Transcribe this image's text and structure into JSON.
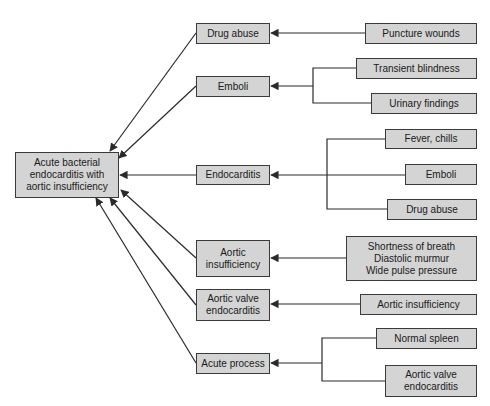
{
  "diagram": {
    "conclusion": "Acute bacterial\nendocarditis with\naortic insufficiency",
    "middle": [
      {
        "id": "drug_abuse",
        "label": "Drug abuse"
      },
      {
        "id": "emboli",
        "label": "Emboli"
      },
      {
        "id": "endocarditis",
        "label": "Endocarditis"
      },
      {
        "id": "aortic_insufficiency",
        "label": "Aortic\ninsufficiency"
      },
      {
        "id": "aortic_valve_endocarditis",
        "label": "Aortic valve\nendocarditis"
      },
      {
        "id": "acute_process",
        "label": "Acute process"
      }
    ],
    "evidence": [
      {
        "label": "Puncture wounds",
        "supports": "drug_abuse"
      },
      {
        "label": "Transient blindness",
        "supports": "emboli"
      },
      {
        "label": "Urinary findings",
        "supports": "emboli"
      },
      {
        "label": "Fever, chills",
        "supports": "endocarditis"
      },
      {
        "label": "Emboli",
        "supports": "endocarditis"
      },
      {
        "label": "Drug abuse",
        "supports": "endocarditis"
      },
      {
        "label": "Shortness of breath\nDiastolic murmur\nWide pulse pressure",
        "supports": "aortic_insufficiency"
      },
      {
        "label": "Aortic insufficiency",
        "supports": "aortic_valve_endocarditis"
      },
      {
        "label": "Normal spleen",
        "supports": "acute_process"
      },
      {
        "label": "Aortic valve\nendocarditis",
        "supports": "acute_process"
      }
    ],
    "colors": {
      "box_fill": "#d4d4d4",
      "box_border": "#3a3a3a",
      "line": "#2a2a2a"
    }
  }
}
